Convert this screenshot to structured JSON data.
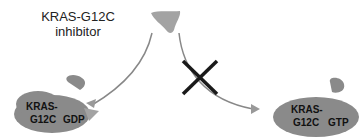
{
  "inhibitor": {
    "title_line1": "KRAS-G12C",
    "title_line2": "inhibitor"
  },
  "left_protein": {
    "name_line1": "KRAS-",
    "name_line2": "G12C",
    "nucleotide": "GDP",
    "state": "inhibitor-bound"
  },
  "right_protein": {
    "name_line1": "KRAS-",
    "name_line2": "G12C",
    "nucleotide": "GTP",
    "state": "blocked"
  },
  "colors": {
    "protein": "#8a8a8a",
    "inhibitor": "#a3a3a3",
    "arrow": "#888888",
    "cross": "#1a1a1a"
  }
}
